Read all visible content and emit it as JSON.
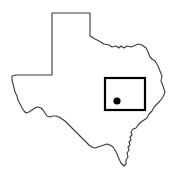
{
  "figure": {
    "title": "Texas state outline locator map",
    "width": 177,
    "height": 178,
    "background_color": "#ffffff"
  },
  "map": {
    "region_name": "Texas",
    "outline": {
      "stroke_color": "#3a3a3a",
      "fill_color": "#ffffff",
      "stroke_width": 1.1,
      "path": "M 52,13 L 90,13 L 90,36 L 95,39 L 99,41 L 104,44 L 109,45 L 112,47 L 116,46 L 119,48 L 121,46 L 124,48 L 127,46 L 131,47 L 134,46 L 138,44 L 142,45 L 146,48 L 148,52 L 150,57 L 152,59 L 155,61 L 158,66 L 160,71 L 162,76 L 161,81 L 163,86 L 165,92 L 163,97 L 160,101 L 157,104 L 154,107 L 152,111 L 149,114 L 147,118 L 144,120 L 141,122 L 138,125 L 136,128 L 133,129 L 131,132 L 132,135 L 130,137 L 131,140 L 129,142 L 130,145 L 128,147 L 129,150 L 127,153 L 128,157 L 126,160 L 126,164 L 124,166 L 121,163 L 119,159 L 117,154 L 115,150 L 113,147 L 110,145 L 107,144 L 104,145 L 101,146 L 98,147 L 95,148 L 92,147 L 89,145 L 86,142 L 83,139 L 80,136 L 77,133 L 74,130 L 71,127 L 68,124 L 65,121 L 62,119 L 59,117 L 56,116 L 53,116 L 50,117 L 47,116 L 45,113 L 43,110 L 41,108 L 38,107 L 35,108 L 32,110 L 29,112 L 26,113 L 24,111 L 22,108 L 20,104 L 18,100 L 17,96 L 15,92 L 14,88 L 13,84 L 12,80 L 12,76 L 16,75 L 22,75 L 30,75 L 38,75 L 45,75 L 52,75 Z"
    },
    "inset_box": {
      "label": "inset rectangle",
      "stroke_color": "#000000",
      "stroke_width": 2.2,
      "x": 105,
      "y": 78,
      "width": 40,
      "height": 32
    },
    "location_marker": {
      "label": "location dot",
      "fill_color": "#000000",
      "cx": 117,
      "cy": 101,
      "r": 3.6
    }
  }
}
